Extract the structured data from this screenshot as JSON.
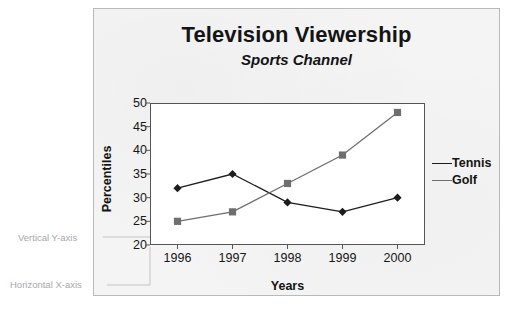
{
  "chart_data": {
    "type": "line",
    "title": "Television Viewership",
    "subtitle": "Sports Channel",
    "xlabel": "Years",
    "ylabel": "Percentiles",
    "categories": [
      "1996",
      "1997",
      "1998",
      "1999",
      "2000"
    ],
    "ylim": [
      20,
      50
    ],
    "yticks": [
      20,
      25,
      30,
      35,
      40,
      45,
      50
    ],
    "grid": false,
    "legend_position": "right",
    "series": [
      {
        "name": "Tennis",
        "marker": "diamond",
        "color": "#1c1c1c",
        "values": [
          32,
          35,
          29,
          27,
          30
        ]
      },
      {
        "name": "Golf",
        "marker": "square",
        "color": "#6e6e6e",
        "values": [
          25,
          27,
          33,
          39,
          48
        ]
      }
    ]
  },
  "annotations": [
    {
      "id": "y-axis-callout",
      "label": "Vertical Y-axis"
    },
    {
      "id": "x-axis-callout",
      "label": "Horizontal X-axis"
    }
  ]
}
